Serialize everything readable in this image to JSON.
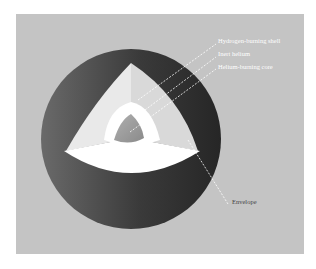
{
  "diagram": {
    "type": "cross-section",
    "background_color": "#c4c4c4",
    "labels": [
      {
        "id": "hydrogen-burning-shell",
        "text": "Hydrogen-burning shell"
      },
      {
        "id": "inert-helium",
        "text": "Inert helium"
      },
      {
        "id": "helium-burning-core",
        "text": "Helium-burning core"
      },
      {
        "id": "envelope",
        "text": "Envelope"
      }
    ],
    "colors": {
      "envelope_outer": "#5a5a5a",
      "envelope_dark": "#2e2e2e",
      "cut_face_light": "#e6e6e6",
      "cut_face_mid": "#d4d4d4",
      "hydrogen_shell": "#ffffff",
      "core": "#9a9a9a"
    }
  }
}
